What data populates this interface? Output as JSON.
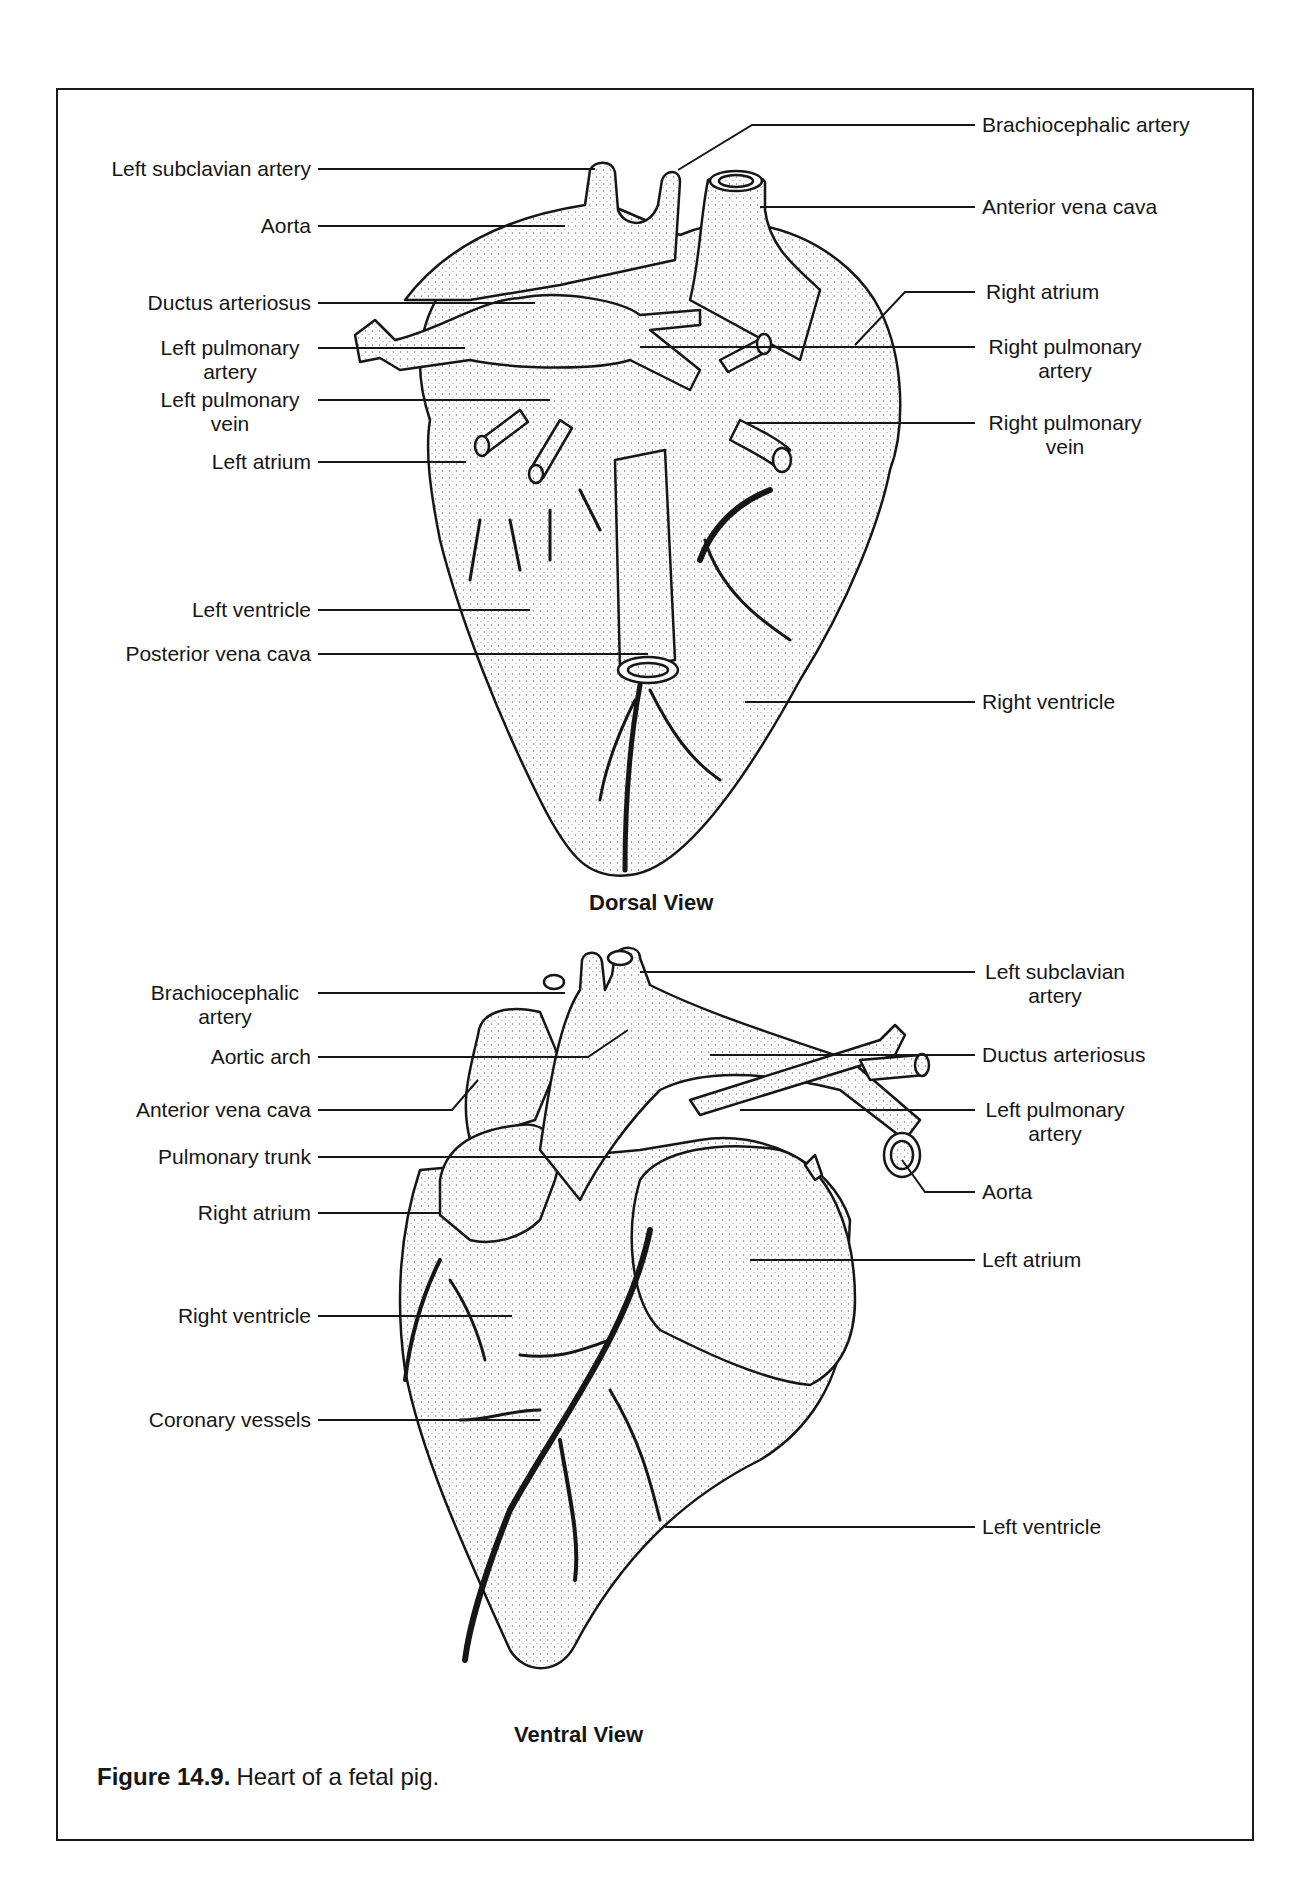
{
  "figure": {
    "number": "Figure 14.9.",
    "caption": "Heart of a fetal pig."
  },
  "dorsal": {
    "title": "Dorsal View",
    "left_labels": [
      {
        "text": "Left subclavian artery"
      },
      {
        "text": "Aorta"
      },
      {
        "text": "Ductus arteriosus"
      },
      {
        "text": "Left pulmonary",
        "text2": "artery"
      },
      {
        "text": "Left pulmonary",
        "text2": "vein"
      },
      {
        "text": "Left atrium"
      },
      {
        "text": "Left ventricle"
      },
      {
        "text": "Posterior vena cava"
      }
    ],
    "right_labels": [
      {
        "text": "Brachiocephalic artery"
      },
      {
        "text": "Anterior vena cava"
      },
      {
        "text": "Right atrium"
      },
      {
        "text": "Right pulmonary",
        "text2": "artery"
      },
      {
        "text": "Right pulmonary",
        "text2": "vein"
      },
      {
        "text": "Right ventricle"
      }
    ]
  },
  "ventral": {
    "title": "Ventral View",
    "left_labels": [
      {
        "text": "Brachiocephalic",
        "text2": "artery"
      },
      {
        "text": "Aortic arch"
      },
      {
        "text": "Anterior vena cava"
      },
      {
        "text": "Pulmonary trunk"
      },
      {
        "text": "Right atrium"
      },
      {
        "text": "Right ventricle"
      },
      {
        "text": "Coronary vessels"
      }
    ],
    "right_labels": [
      {
        "text": "Left subclavian",
        "text2": "artery"
      },
      {
        "text": "Ductus arteriosus"
      },
      {
        "text": "Left pulmonary",
        "text2": "artery"
      },
      {
        "text": "Aorta"
      },
      {
        "text": "Left atrium"
      },
      {
        "text": "Left ventricle"
      }
    ]
  },
  "colors": {
    "ink": "#161616",
    "paper": "#ffffff",
    "stipple": "#e6e6e6"
  }
}
